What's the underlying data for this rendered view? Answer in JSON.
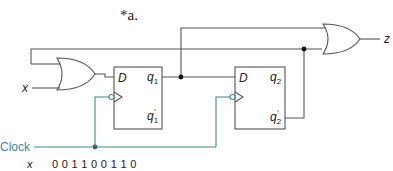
{
  "title": "*a.",
  "colors": {
    "wire": "#555555",
    "clock": "#3a8a95",
    "text": "#222222"
  },
  "flipflops": [
    {
      "name": "ff1",
      "d_label": "D",
      "q_label": "q",
      "q_sub": "1",
      "qn_label": "q",
      "qn_sub": "1",
      "qn_prime": "′"
    },
    {
      "name": "ff2",
      "d_label": "D",
      "q_label": "q",
      "q_sub": "2",
      "qn_label": "q",
      "qn_sub": "2",
      "qn_prime": "′"
    }
  ],
  "inputs": {
    "x": "x",
    "clock": "Clock"
  },
  "outputs": {
    "z": "z"
  },
  "sequence": {
    "label": "x",
    "values": "0 0 1 1 0 0 1 1 0"
  }
}
